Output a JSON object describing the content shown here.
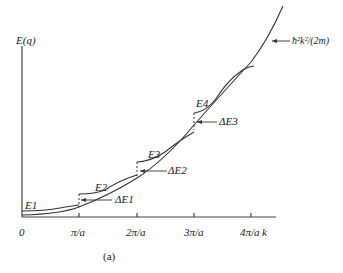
{
  "figure": {
    "y_axis_label": "E(q)",
    "x_axis_label": "k",
    "caption": "(a)",
    "free_curve_label": "ħ²k²/(2m)",
    "x_ticks": [
      "0",
      "π/a",
      "2π/a",
      "3π/a",
      "4π/a"
    ],
    "band_labels": [
      "E1",
      "E2",
      "E3",
      "E4"
    ],
    "gap_labels": [
      "ΔE1",
      "ΔE2",
      "ΔE3"
    ]
  }
}
